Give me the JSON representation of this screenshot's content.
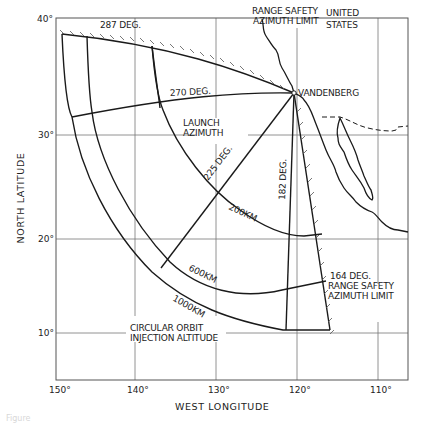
{
  "figure": {
    "caption": "Figure",
    "x_axis": {
      "label": "WEST LONGITUDE",
      "ticks": [
        "150°",
        "140°",
        "130°",
        "120°",
        "110°"
      ]
    },
    "y_axis": {
      "label": "NORTH LATITUDE",
      "ticks": [
        "40°",
        "30°",
        "20°",
        "10°"
      ]
    },
    "labels": {
      "az_287": "287 DEG.",
      "range_safety_north_1": "RANGE SAFETY",
      "range_safety_north_2": "AZIMUTH LIMIT",
      "united_1": "UNITED",
      "united_2": "STATES",
      "vandenberg": "VANDENBERG",
      "az_270": "270 DEG.",
      "launch_1": "LAUNCH",
      "launch_2": "AZIMUTH",
      "az_225": "225 DEG.",
      "az_182": "182 DEG.",
      "alt_200": "200KM",
      "alt_600": "600KM",
      "alt_1000": "1000KM",
      "az_164": "164 DEG.",
      "range_safety_south_1": "RANGE SAFETY",
      "range_safety_south_2": "AZIMUTH LIMIT",
      "circular_1": "CIRCULAR ORBIT",
      "circular_2": "INJECTION ALTITUDE"
    },
    "launch_site": "Vandenberg",
    "launch_azimuths_deg": [
      287,
      270,
      225,
      182,
      164
    ],
    "injection_altitudes_km": [
      200,
      600,
      1000
    ],
    "range_safety_limits_deg": [
      287,
      164
    ]
  }
}
